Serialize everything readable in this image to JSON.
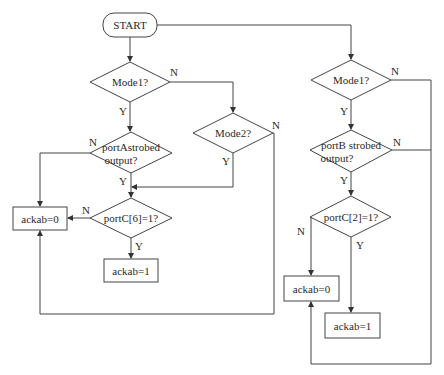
{
  "diagram": {
    "type": "flowchart",
    "start": {
      "label": "START"
    },
    "left_branch": {
      "mode1": {
        "label": "Mode1?",
        "yes": "Y",
        "no": "N"
      },
      "porta": {
        "label_line1": "portAstrobed",
        "label_line2": "output?",
        "yes": "Y",
        "no": "N"
      },
      "mode2": {
        "label": "Mode2?",
        "yes": "Y",
        "no": "N"
      },
      "portc": {
        "label": "portC[6]=1?",
        "yes": "Y",
        "no": "N"
      },
      "ack0": {
        "label": "ackab=0"
      },
      "ack1": {
        "label": "ackab=1"
      }
    },
    "right_branch": {
      "mode1": {
        "label": "Mode1?",
        "yes": "Y",
        "no": "N"
      },
      "portb": {
        "label_line1": "portB strobed",
        "label_line2": "output?",
        "yes": "Y",
        "no": "N"
      },
      "portc": {
        "label": "portC[2]=1?",
        "yes": "Y",
        "no": "N"
      },
      "ack0": {
        "label": "ackab=0"
      },
      "ack1": {
        "label": "ackab=1"
      }
    }
  }
}
